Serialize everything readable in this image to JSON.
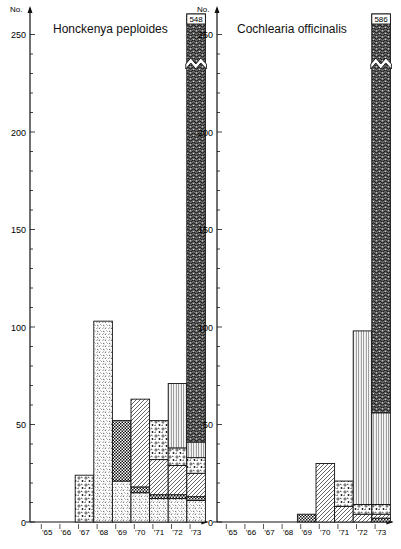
{
  "chart_data": [
    {
      "type": "bar",
      "stacked": true,
      "title": "Honckenya peploides",
      "ylabel": "No.",
      "xlabel": "",
      "categories": [
        "'65",
        "'66",
        "'67",
        "'68",
        "'69",
        "'70",
        "'71",
        "'72",
        "'73"
      ],
      "yticks": [
        0,
        50,
        100,
        150,
        200,
        250
      ],
      "ylim": [
        0,
        260
      ],
      "broken_bar": {
        "category": "'73",
        "total_label": "548"
      },
      "series": [
        {
          "name": "fine-dash",
          "values": [
            0,
            0,
            0,
            103,
            21,
            15,
            12,
            12,
            11
          ]
        },
        {
          "name": "checker",
          "values": [
            0,
            0,
            0,
            0,
            31,
            3,
            2,
            2,
            2
          ]
        },
        {
          "name": "diagonal",
          "values": [
            0,
            0,
            0,
            0,
            0,
            45,
            18,
            15,
            12
          ]
        },
        {
          "name": "coarse-stipple",
          "values": [
            0,
            0,
            24,
            0,
            0,
            0,
            20,
            9,
            8
          ]
        },
        {
          "name": "vertical-lines",
          "values": [
            0,
            0,
            0,
            0,
            0,
            0,
            0,
            33,
            8
          ]
        },
        {
          "name": "dense-dark",
          "values": [
            0,
            0,
            0,
            0,
            0,
            0,
            0,
            0,
            507
          ]
        }
      ]
    },
    {
      "type": "bar",
      "stacked": true,
      "title": "Cochlearia officinalis",
      "ylabel": "No.",
      "xlabel": "",
      "categories": [
        "'65",
        "'66",
        "'67",
        "'68",
        "'69",
        "'70",
        "'71",
        "'72",
        "'73"
      ],
      "yticks": [
        0,
        50,
        100,
        150,
        200,
        250
      ],
      "ylim": [
        0,
        260
      ],
      "broken_bar": {
        "category": "'73",
        "total_label": "586"
      },
      "series": [
        {
          "name": "checker",
          "values": [
            0,
            0,
            0,
            0,
            4,
            0,
            0,
            0,
            2
          ]
        },
        {
          "name": "diagonal",
          "values": [
            0,
            0,
            0,
            0,
            0,
            30,
            8,
            4,
            2
          ]
        },
        {
          "name": "coarse-stipple",
          "values": [
            0,
            0,
            0,
            0,
            0,
            0,
            13,
            5,
            5
          ]
        },
        {
          "name": "vertical-lines",
          "values": [
            0,
            0,
            0,
            0,
            0,
            0,
            0,
            89,
            47
          ]
        },
        {
          "name": "dense-dark",
          "values": [
            0,
            0,
            0,
            0,
            0,
            0,
            0,
            0,
            530
          ]
        }
      ]
    }
  ],
  "labels": {
    "left_title": "Honckenya peploides",
    "right_title": "Cochlearia officinalis",
    "y_unit": "No.",
    "left_break_total": "548",
    "right_break_total": "586"
  }
}
